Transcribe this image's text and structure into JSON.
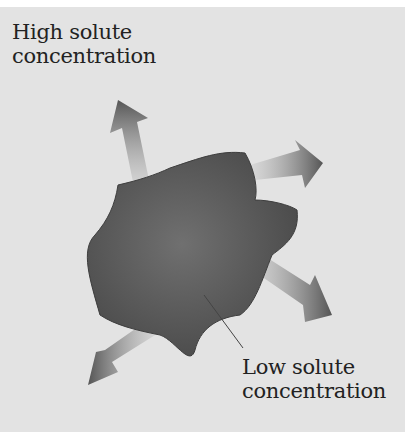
{
  "figure": {
    "labels": {
      "high": {
        "line1": "High solute",
        "line2": "concentration"
      },
      "low": {
        "line1": "Low solute",
        "line2": "concentration"
      }
    },
    "colors": {
      "background": "#e3e3e3",
      "cell": "#5e5e5e",
      "arrow": "#555555"
    },
    "arrows": [
      {
        "name": "arrow-up-left",
        "direction": "upper-left"
      },
      {
        "name": "arrow-up-right",
        "direction": "upper-right"
      },
      {
        "name": "arrow-down-right",
        "direction": "lower-right"
      },
      {
        "name": "arrow-down-left",
        "direction": "lower-left"
      }
    ]
  }
}
